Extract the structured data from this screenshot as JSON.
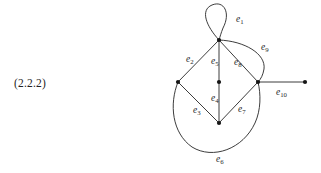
{
  "figure": {
    "equation_number": "(2.2.2)",
    "type": "undirected-multigraph-diagram",
    "colors": {
      "stroke": "#262626",
      "vertex": "#151515",
      "text": "#1f1f1f",
      "background": "#ffffff"
    },
    "vertices": [
      {
        "id": "v_top",
        "name": "top-vertex",
        "x": 219,
        "y": 40
      },
      {
        "id": "v_left",
        "name": "left-vertex",
        "x": 178,
        "y": 82
      },
      {
        "id": "v_center",
        "name": "center-vertex",
        "x": 219,
        "y": 82
      },
      {
        "id": "v_right",
        "name": "right-vertex",
        "x": 258,
        "y": 82
      },
      {
        "id": "v_bottom",
        "name": "bottom-vertex",
        "x": 219,
        "y": 123
      },
      {
        "id": "v_far",
        "name": "far-right-vertex",
        "x": 305,
        "y": 82
      }
    ],
    "edges": [
      {
        "id": "e1",
        "label": "e",
        "sub": "1",
        "from": "v_top",
        "to": "v_top",
        "shape": "loop",
        "label_x": 236,
        "label_y": 22
      },
      {
        "id": "e2",
        "label": "e",
        "sub": "2",
        "from": "v_top",
        "to": "v_left",
        "shape": "straight",
        "label_x": 186,
        "label_y": 62
      },
      {
        "id": "e3",
        "label": "e",
        "sub": "3",
        "from": "v_left",
        "to": "v_bottom",
        "shape": "straight",
        "label_x": 193,
        "label_y": 113
      },
      {
        "id": "e4",
        "label": "e",
        "sub": "4",
        "from": "v_center",
        "to": "v_bottom",
        "shape": "straight",
        "label_x": 211,
        "label_y": 101
      },
      {
        "id": "e5",
        "label": "e",
        "sub": "5",
        "from": "v_top",
        "to": "v_center",
        "shape": "straight",
        "label_x": 211,
        "label_y": 64
      },
      {
        "id": "e6",
        "label": "e",
        "sub": "6",
        "from": "v_left",
        "to": "v_right",
        "shape": "curve-bottom",
        "label_x": 216,
        "label_y": 162
      },
      {
        "id": "e7",
        "label": "e",
        "sub": "7",
        "from": "v_bottom",
        "to": "v_right",
        "shape": "straight",
        "label_x": 238,
        "label_y": 112
      },
      {
        "id": "e8",
        "label": "e",
        "sub": "8",
        "from": "v_top",
        "to": "v_right",
        "shape": "straight",
        "label_x": 234,
        "label_y": 65
      },
      {
        "id": "e9",
        "label": "e",
        "sub": "9",
        "from": "v_top",
        "to": "v_right",
        "shape": "curve-right",
        "label_x": 261,
        "label_y": 50
      },
      {
        "id": "e10",
        "label": "e",
        "sub": "10",
        "from": "v_right",
        "to": "v_far",
        "shape": "straight",
        "label_x": 276,
        "label_y": 95
      }
    ]
  }
}
